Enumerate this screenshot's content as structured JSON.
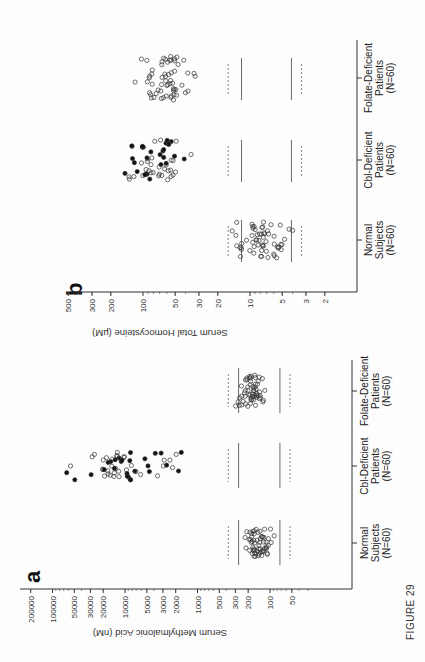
{
  "figure": {
    "label": "FIGURE 29",
    "orientation": "rotated 90° counter-clockwise"
  },
  "chart_data": [
    {
      "panel": "a",
      "type": "scatter",
      "subtype": "dot-plot (strip chart) with open and filled circles",
      "title": "",
      "ylabel": "Serum Methylmalonic Acid (nM)",
      "xlabel": "",
      "yscale": "log",
      "ylim": [
        30,
        200000
      ],
      "yticks": [
        200000,
        100000,
        50000,
        30000,
        20000,
        10000,
        5000,
        3000,
        2000,
        1000,
        500,
        300,
        200,
        100,
        50
      ],
      "ytick_labels": [
        "200000",
        "100000",
        "50000",
        "30000",
        "20000",
        "10000",
        "5000",
        "3000",
        "2000",
        "1000",
        "500",
        "300",
        "200",
        "100",
        "50"
      ],
      "categories": [
        "Normal Subjects (N=60)",
        "Cbl-Deficient Patients (N=60)",
        "Folate-Deficient Patients (N=60)"
      ],
      "category_lines": [
        [
          "Normal",
          "Subjects",
          "(N=60)"
        ],
        [
          "Cbl-Deficient",
          "Patients",
          "(N=60)"
        ],
        [
          "Folate-Deficient",
          "Patients",
          "(N=60)"
        ]
      ],
      "reference_lines": {
        "solid": [
          271,
          73
        ],
        "dashed": [
          376,
          53
        ],
        "note": "solid = normal range (mean ± 2 SD), dashed = (mean ± 3 SD) approx."
      },
      "series": [
        {
          "name": "Normal Subjects",
          "marker": "open",
          "n": 60,
          "approx_range": [
            73,
            420
          ],
          "approx_center": 140
        },
        {
          "name": "Cbl-Deficient Patients",
          "marker": "mixed open/filled",
          "n": 60,
          "approx_range": [
            260,
            200000
          ],
          "approx_center": 10000
        },
        {
          "name": "Folate-Deficient Patients",
          "marker": "open",
          "n": 60,
          "approx_range": [
            85,
            600
          ],
          "approx_center": 180
        }
      ],
      "grid": false,
      "legend": "none"
    },
    {
      "panel": "b",
      "type": "scatter",
      "subtype": "dot-plot (strip chart) with open and filled circles",
      "title": "",
      "ylabel": "Serum Total Homocysteine (µM)",
      "xlabel": "",
      "yscale": "log",
      "ylim": [
        1.5,
        500
      ],
      "yticks": [
        500,
        300,
        200,
        100,
        50,
        30,
        20,
        10,
        5,
        3,
        2
      ],
      "ytick_labels": [
        "500",
        "300",
        "200",
        "100",
        "50",
        "30",
        "20",
        "10",
        "5",
        "3",
        "2"
      ],
      "categories": [
        "Normal Subjects (N=60)",
        "Cbl-Deficient Patients (N=60)",
        "Folate-Deficient Patients (N=60)"
      ],
      "category_lines": [
        [
          "Normal",
          "Subjects",
          "(N=60)"
        ],
        [
          "Cbl-Deficient",
          "Patients",
          "(N=60)"
        ],
        [
          "Folate-Deficient",
          "Patients",
          "(N=60)"
        ]
      ],
      "reference_lines": {
        "solid": [
          12,
          4.1
        ],
        "dashed": [
          16,
          3.3
        ]
      },
      "series": [
        {
          "name": "Normal Subjects",
          "marker": "open",
          "n": 60,
          "approx_range": [
            3.5,
            30
          ],
          "approx_center": 7.5
        },
        {
          "name": "Cbl-Deficient Patients",
          "marker": "mixed open/filled",
          "n": 60,
          "approx_range": [
            20,
            270
          ],
          "approx_center": 80
        },
        {
          "name": "Folate-Deficient Patients",
          "marker": "open",
          "n": 60,
          "approx_range": [
            18,
            230
          ],
          "approx_center": 60
        }
      ],
      "grid": false,
      "legend": "none"
    }
  ],
  "labels": {
    "panel_a": "a",
    "panel_b": "b",
    "a_ylabel": "Serum Methylmalonic Acid (nM)",
    "b_ylabel": "Serum Total Homocysteine (µM)",
    "cat_normal_1": "Normal",
    "cat_normal_2": "Subjects",
    "cat_normal_3": "(N=60)",
    "cat_cbl_1": "Cbl-Deficient",
    "cat_cbl_2": "Patients",
    "cat_cbl_3": "(N=60)",
    "cat_folate_1": "Folate-Deficient",
    "cat_folate_2": "Patients",
    "cat_folate_3": "(N=60)"
  },
  "ticks_a": [
    "200000",
    "100000",
    "50000",
    "30000",
    "20000",
    "10000",
    "5000",
    "3000",
    "2000",
    "1000",
    "500",
    "300",
    "200",
    "100",
    "50"
  ],
  "ticks_b": [
    "500",
    "300",
    "200",
    "100",
    "50",
    "30",
    "20",
    "10",
    "5",
    "3",
    "2"
  ]
}
